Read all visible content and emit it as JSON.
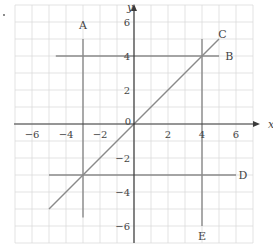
{
  "diagram": {
    "type": "coordinate-plane",
    "axes": {
      "x_label": "x",
      "y_label": "y",
      "origin_label": "0",
      "x_range": [
        -7,
        7
      ],
      "y_range": [
        -7,
        7
      ],
      "x_ticks": [
        {
          "value": -6,
          "label": "−6"
        },
        {
          "value": -4,
          "label": "−4"
        },
        {
          "value": -2,
          "label": "−2"
        },
        {
          "value": 2,
          "label": "2"
        },
        {
          "value": 4,
          "label": "4"
        },
        {
          "value": 6,
          "label": "6"
        }
      ],
      "y_ticks": [
        {
          "value": 6,
          "label": "6"
        },
        {
          "value": 4,
          "label": "4"
        },
        {
          "value": 2,
          "label": "2"
        },
        {
          "value": -2,
          "label": "−2"
        },
        {
          "value": -4,
          "label": "−4"
        },
        {
          "value": -6,
          "label": "−6"
        }
      ],
      "grid": true,
      "grid_step": 1
    },
    "lines": [
      {
        "label": "A",
        "equation": "x = -3",
        "from": [
          -3,
          5
        ],
        "to": [
          -3,
          -5.5
        ],
        "label_at": [
          -3,
          5.8
        ]
      },
      {
        "label": "B",
        "equation": "y = 4",
        "from": [
          -4.6,
          4
        ],
        "to": [
          5,
          4
        ],
        "label_at": [
          5.6,
          4
        ]
      },
      {
        "label": "C",
        "equation": "y = x",
        "from": [
          -5,
          -5
        ],
        "to": [
          5,
          5
        ],
        "label_at": [
          5.2,
          5.3
        ]
      },
      {
        "label": "D",
        "equation": "y = -3",
        "from": [
          -5,
          -3
        ],
        "to": [
          6,
          -3
        ],
        "label_at": [
          6.4,
          -3
        ]
      },
      {
        "label": "E",
        "equation": "x = 4",
        "from": [
          4,
          5
        ],
        "to": [
          4,
          -6
        ],
        "label_at": [
          4,
          -6.6
        ]
      }
    ],
    "colors": {
      "grid": "#dcdcdc",
      "axis": "#3a3a3a",
      "line": "#8a8a8a",
      "text": "#444444"
    }
  }
}
